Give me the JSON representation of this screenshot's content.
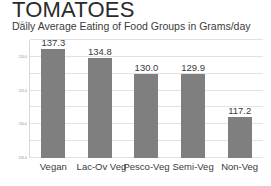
{
  "chart_data": {
    "type": "bar",
    "title": "TOMATOES",
    "subtitle": "Daily Average Eating of Food Groups in Grams/day",
    "xlabel": "",
    "ylabel": "",
    "categories": [
      "Vegan",
      "Lac-Ov Veg",
      "Pesco-Veg",
      "Semi-Veg",
      "Non-Veg"
    ],
    "values": [
      137.3,
      134.8,
      130.0,
      129.9,
      117.2
    ],
    "value_labels": [
      "137.3",
      "134.8",
      "130.0",
      "129.9",
      "117.2"
    ],
    "ylim": [
      105.0,
      140.0
    ],
    "yticks": [
      105.0,
      110.0,
      115.0,
      120.0,
      125.0,
      130.0,
      135.0,
      140.0
    ],
    "ytick_labels": [
      "105.0",
      "110.0",
      "115.0",
      "120.0",
      "125.0",
      "130.0",
      "135.0",
      "140.0"
    ],
    "grid": true,
    "legend": false,
    "legend_position": "none",
    "bar_color": "#7f7f7f",
    "gridline_color": "#e2e2e2",
    "background_color": "#ffffff",
    "text_color": "#3a3a3a"
  }
}
